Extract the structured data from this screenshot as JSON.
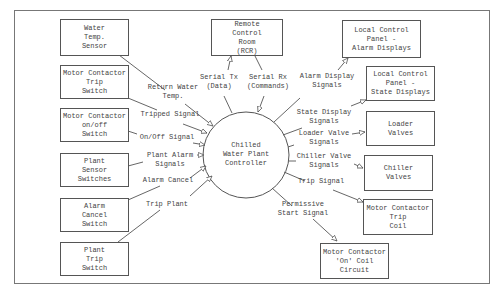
{
  "diagram": {
    "center": {
      "lines": [
        "Chilled",
        "Water Plant",
        "Controller"
      ]
    },
    "boxes": {
      "water_temp_sensor": [
        "Water",
        "Temp.",
        "Sensor"
      ],
      "mc_trip_switch": [
        "Motor Contactor",
        "Trip",
        "Switch"
      ],
      "mc_onoff_switch": [
        "Motor Contactor",
        "on/off",
        "Switch"
      ],
      "plant_sensor_switches": [
        "Plant",
        "Sensor",
        "Switches"
      ],
      "alarm_cancel_switch": [
        "Alarm",
        "Cancel",
        "Switch"
      ],
      "plant_trip_switch": [
        "Plant",
        "Trip",
        "Switch"
      ],
      "remote_control_room": [
        "Remote",
        "Control",
        "Room",
        "(RCR)"
      ],
      "lcp_alarm_displays": [
        "Local Control",
        "Panel -",
        "Alarm Displays"
      ],
      "lcp_state_displays": [
        "Local Control",
        "Panel -",
        "State Displays"
      ],
      "loader_valves": [
        "Loader",
        "Valves"
      ],
      "chiller_valves": [
        "Chiller",
        "Valves"
      ],
      "mc_trip_coil": [
        "Motor Contactor",
        "Trip",
        "Coil"
      ],
      "mc_on_coil_circuit": [
        "Motor Contactor",
        "'On' Coil",
        "Circuit"
      ]
    },
    "flows": {
      "return_water_temp": [
        "Return Water",
        "Temp."
      ],
      "tripped_signal": [
        "Tripped Signal"
      ],
      "onoff_signal": [
        "On/Off Signal"
      ],
      "plant_alarm_signals": [
        "Plant Alarm",
        "Signals"
      ],
      "alarm_cancel": [
        "Alarm Cancel"
      ],
      "trip_plant": [
        "Trip Plant"
      ],
      "serial_tx": [
        "Serial Tx",
        "(Data)"
      ],
      "serial_rx": [
        "Serial Rx",
        "(Commands)"
      ],
      "alarm_display_signals": [
        "Alarm Display",
        "Signals"
      ],
      "state_display_signals": [
        "State Display",
        "Signals"
      ],
      "loader_valve_signals": [
        "Loader Valve",
        "Signals"
      ],
      "chiller_valve_signals": [
        "Chiller Valve",
        "Signals"
      ],
      "trip_signal": [
        "Trip Signal"
      ],
      "permissive_start_signal": [
        "Permissive",
        "Start Signal"
      ]
    },
    "colors": {
      "line": "#555555",
      "text": "#444444",
      "background": "#ffffff"
    }
  }
}
